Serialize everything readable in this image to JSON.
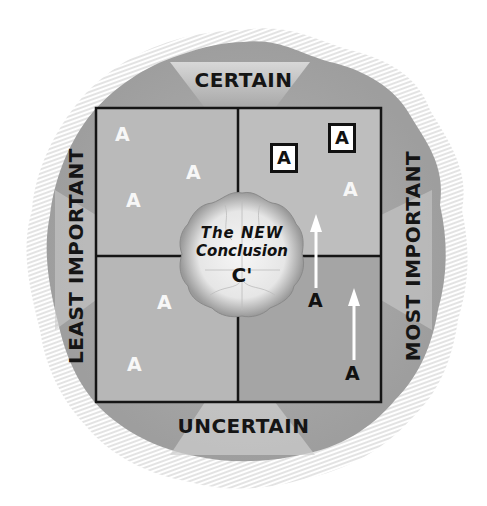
{
  "diagram": {
    "axes": {
      "top": "CERTAIN",
      "bottom": "UNCERTAIN",
      "left": "LEAST IMPORTANT",
      "right": "MOST IMPORTANT"
    },
    "center": {
      "line1": "The NEW",
      "line2": "Conclusion",
      "symbol": "C'"
    },
    "quadrants": {
      "top_left": {
        "items": [
          "A",
          "A",
          "A"
        ],
        "style": "white"
      },
      "top_right": {
        "items_boxed": [
          "A",
          "A"
        ],
        "items_white": [
          "A"
        ]
      },
      "bottom_left": {
        "items": [
          "A",
          "A"
        ],
        "style": "white"
      },
      "bottom_right": {
        "items_dark": [
          "A",
          "A"
        ],
        "arrows": 2
      }
    },
    "colors": {
      "quadrant_light": "#b9b9b9",
      "quadrant_dark": "#a3a3a3",
      "blob": "#a9a9a9",
      "grid_line": "#151515",
      "cloud": "#eeeeee"
    }
  }
}
